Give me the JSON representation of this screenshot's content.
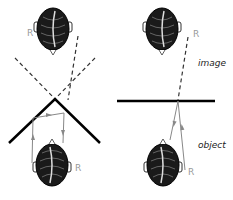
{
  "labels": {
    "image": "image",
    "object": "object",
    "r_mark": "R"
  },
  "panels": [
    {
      "name": "corner-reflector",
      "description": "two mirrors at right angle, image not reversed"
    },
    {
      "name": "plane-mirror",
      "description": "single plane mirror, image reversed"
    }
  ],
  "colors": {
    "ink": "#111111",
    "ray": "#888888",
    "label_r": "#999999"
  }
}
